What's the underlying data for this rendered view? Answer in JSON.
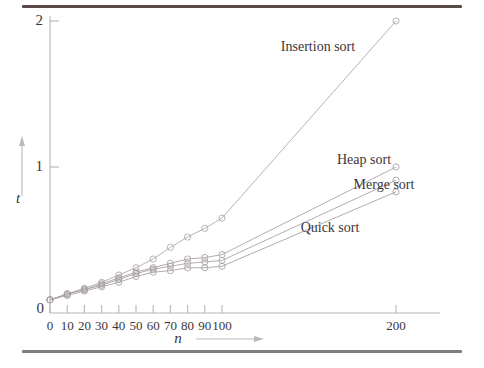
{
  "figure": {
    "name": "sorting-algorithm-runtime-plot",
    "frame_color_top": "#5b4a4a",
    "frame_color_bottom": "#7d7c80",
    "background": "#ffffff"
  },
  "chart_data": {
    "type": "line",
    "title": "",
    "xlabel": "n",
    "ylabel": "t",
    "xlim": [
      0,
      215
    ],
    "ylim": [
      0,
      2.05
    ],
    "grid": false,
    "legend": "inline-annotations",
    "xticks": [
      0,
      10,
      20,
      30,
      40,
      50,
      60,
      70,
      80,
      90,
      100,
      200
    ],
    "xtick_labels": [
      "0",
      "10",
      "20",
      "30",
      "40",
      "50",
      "60",
      "70",
      "80",
      "90",
      "100",
      "200"
    ],
    "yticks": [
      0,
      1,
      2
    ],
    "ytick_labels": [
      "0",
      "1",
      "2"
    ],
    "marker": "open-circle",
    "series": [
      {
        "name": "Insertion sort",
        "label": "Insertion sort",
        "color": "#b0a8ad",
        "label_x": 318,
        "label_y": 40,
        "x": [
          0,
          10,
          20,
          30,
          40,
          50,
          60,
          70,
          80,
          90,
          100,
          200
        ],
        "y": [
          0.09,
          0.13,
          0.17,
          0.21,
          0.26,
          0.31,
          0.37,
          0.45,
          0.52,
          0.58,
          0.65,
          2.0
        ]
      },
      {
        "name": "Heap sort",
        "label": "Heap sort",
        "color": "#a9a2a7",
        "label_x": 364,
        "label_y": 153,
        "x": [
          0,
          10,
          20,
          30,
          40,
          50,
          60,
          70,
          80,
          90,
          100,
          200
        ],
        "y": [
          0.09,
          0.13,
          0.16,
          0.2,
          0.24,
          0.28,
          0.31,
          0.34,
          0.37,
          0.38,
          0.4,
          1.0
        ]
      },
      {
        "name": "Merge sort",
        "label": "Merge sort",
        "color": "#a9a2a7",
        "label_x": 384,
        "label_y": 178,
        "x": [
          0,
          10,
          20,
          30,
          40,
          50,
          60,
          70,
          80,
          90,
          100,
          200
        ],
        "y": [
          0.09,
          0.13,
          0.16,
          0.19,
          0.23,
          0.27,
          0.3,
          0.32,
          0.34,
          0.35,
          0.36,
          0.91
        ]
      },
      {
        "name": "Quick sort",
        "label": "Quick sort",
        "color": "#a9a2a7",
        "label_x": 330,
        "label_y": 221,
        "x": [
          0,
          10,
          20,
          30,
          40,
          50,
          60,
          70,
          80,
          90,
          100,
          200
        ],
        "y": [
          0.09,
          0.12,
          0.15,
          0.18,
          0.21,
          0.25,
          0.28,
          0.29,
          0.31,
          0.31,
          0.32,
          0.83
        ]
      }
    ]
  }
}
